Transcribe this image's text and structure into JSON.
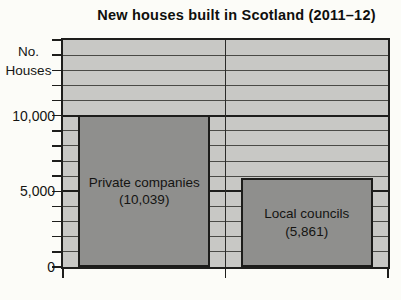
{
  "chart_data": {
    "type": "bar",
    "title": "New houses built in Scotland (2011–12)",
    "ylabel": "No. Houses",
    "ylabel_lines": [
      "No.",
      "Houses"
    ],
    "xlabel": "",
    "categories": [
      "Private companies",
      "Local councils"
    ],
    "values": [
      10039,
      5861
    ],
    "bars": [
      {
        "label": "Private companies",
        "value": 10039,
        "value_label": "(10,039)"
      },
      {
        "label": "Local councils",
        "value": 5861,
        "value_label": "(5,861)"
      }
    ],
    "ylim": [
      0,
      15000
    ],
    "axes": {
      "y_minor_step": 1000,
      "y_major_step": 5000,
      "y_tick_labels": [
        {
          "value": 0,
          "label": "0"
        },
        {
          "value": 5000,
          "label": "5,000"
        },
        {
          "value": 10000,
          "label": "10,000"
        }
      ]
    },
    "grid": "horizontal, minor every 1000, major every 5000",
    "legend": "none",
    "colors": {
      "page_bg": "#fcfcf8",
      "plot_bg": "#c8c8c5",
      "bar_fill": "#8f8f8d",
      "line": "#1e1e1c",
      "minor_gridline": "#4a4a46",
      "text": "#141412"
    }
  }
}
